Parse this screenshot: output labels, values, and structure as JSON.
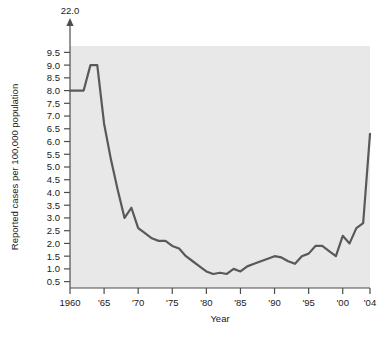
{
  "chart_data": {
    "type": "line",
    "title": "",
    "xlabel": "Year",
    "ylabel": "Reported cases per 100,000 population",
    "xlim": [
      1960,
      2004
    ],
    "ylim": [
      0.25,
      9.75
    ],
    "grid": false,
    "legend": null,
    "axis_break": {
      "present": true,
      "label": "22.0",
      "arrow": "up-arrow-icon",
      "note": "y-axis is broken above 9.5; topmost value shown is 22.0"
    },
    "y_ticks": [
      "9.5",
      "9.0",
      "8.5",
      "8.0",
      "7.5",
      "7.0",
      "6.5",
      "6.0",
      "5.5",
      "5.0",
      "4.5",
      "4.0",
      "3.5",
      "3.0",
      "2.5",
      "2.0",
      "1.5",
      "1.0",
      "0.5"
    ],
    "y_tick_values": [
      9.5,
      9.0,
      8.5,
      8.0,
      7.5,
      7.0,
      6.5,
      6.0,
      5.5,
      5.0,
      4.5,
      4.0,
      3.5,
      3.0,
      2.5,
      2.0,
      1.5,
      1.0,
      0.5
    ],
    "x_ticks": [
      "1960",
      "'65",
      "'70",
      "'75",
      "'80",
      "'85",
      "'90",
      "'95",
      "'00",
      "'04"
    ],
    "x_tick_values": [
      1960,
      1965,
      1970,
      1975,
      1980,
      1985,
      1990,
      1995,
      2000,
      2004
    ],
    "x": [
      1960,
      1961,
      1962,
      1963,
      1964,
      1965,
      1966,
      1967,
      1968,
      1969,
      1970,
      1971,
      1972,
      1973,
      1974,
      1975,
      1976,
      1977,
      1978,
      1979,
      1980,
      1981,
      1982,
      1983,
      1984,
      1985,
      1986,
      1987,
      1988,
      1989,
      1990,
      1991,
      1992,
      1993,
      1994,
      1995,
      1996,
      1997,
      1998,
      1999,
      2000,
      2001,
      2002,
      2003,
      2004
    ],
    "values": [
      8.0,
      8.0,
      8.0,
      9.0,
      9.0,
      6.7,
      5.3,
      4.1,
      3.0,
      3.4,
      2.6,
      2.4,
      2.2,
      2.1,
      2.1,
      1.9,
      1.8,
      1.5,
      1.3,
      1.1,
      0.9,
      0.8,
      0.85,
      0.8,
      1.0,
      0.9,
      1.1,
      1.2,
      1.3,
      1.4,
      1.5,
      1.45,
      1.3,
      1.2,
      1.5,
      1.6,
      1.9,
      1.9,
      1.7,
      1.5,
      2.3,
      2.0,
      2.6,
      2.8,
      6.3
    ],
    "series_color": "#595959",
    "plot_background": "#e8e8e8",
    "line_width": 2.2
  },
  "axis": {
    "x_title": "Year",
    "y_title": "Reported cases per 100,000 population",
    "break_value": "22.0"
  }
}
